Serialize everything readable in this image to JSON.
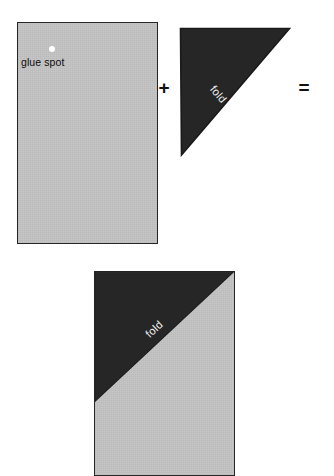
{
  "diagram": {
    "colors": {
      "paper_gray": "#c4c4c4",
      "fold_dark": "#262626",
      "outline": "#262626",
      "glue_dot": "#ffffff",
      "fold_text": "#f2f2f2",
      "label_text": "#0d0d0d",
      "background": "#ffffff"
    },
    "operators": {
      "plus": "+",
      "equals": "="
    },
    "step_one": {
      "name": "rectangular sheet with glue spot",
      "glue_label": "glue spot",
      "glue_dot_name": "glue-spot-dot"
    },
    "step_two": {
      "name": "dark triangular flap",
      "fold_label": "fold"
    },
    "result": {
      "name": "assembled sheet with folded corner",
      "fold_label": "fold"
    }
  }
}
